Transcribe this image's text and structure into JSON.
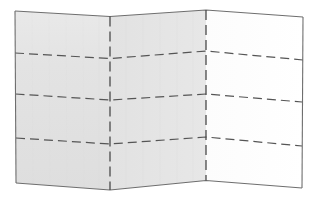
{
  "figure": {
    "width": 315,
    "height": 200,
    "background_color": "#ffffff"
  },
  "colors": {
    "panel_shaded": "#e2e2e2",
    "panel_shaded_light": "#e6e6e6",
    "panel_white": "#ffffff",
    "outline": "#6e6e6e",
    "crease_dash": "#555555",
    "fold_dash": "#4a4a4a"
  },
  "geometry": {
    "vertices": {
      "left_top": {
        "x": 15,
        "y": 11
      },
      "left_bottom": {
        "x": 16,
        "y": 183
      },
      "fold1_top": {
        "x": 110,
        "y": 16.5
      },
      "fold1_bottom": {
        "x": 110,
        "y": 190
      },
      "fold2_top": {
        "x": 206,
        "y": 10
      },
      "fold2_bottom": {
        "x": 206,
        "y": 180.5
      },
      "right_top": {
        "x": 303,
        "y": 17
      },
      "right_bottom": {
        "x": 302,
        "y": 188
      }
    },
    "creases": [
      {
        "name": "crease-1",
        "points": [
          {
            "x": 15,
            "y": 53
          },
          {
            "x": 110,
            "y": 58.5
          },
          {
            "x": 206,
            "y": 51
          },
          {
            "x": 303,
            "y": 60
          }
        ]
      },
      {
        "name": "crease-2",
        "points": [
          {
            "x": 15.5,
            "y": 94
          },
          {
            "x": 110,
            "y": 100
          },
          {
            "x": 206,
            "y": 94
          },
          {
            "x": 302,
            "y": 102
          }
        ]
      },
      {
        "name": "crease-3",
        "points": [
          {
            "x": 16,
            "y": 138
          },
          {
            "x": 110,
            "y": 144
          },
          {
            "x": 206,
            "y": 137
          },
          {
            "x": 302,
            "y": 146
          }
        ]
      }
    ]
  },
  "panels": [
    {
      "id": "panel-left",
      "label": "left-panel",
      "fill": "#e2e2e2",
      "shaded": true
    },
    {
      "id": "panel-middle",
      "label": "middle-panel",
      "fill": "#e4e4e4",
      "shaded": true
    },
    {
      "id": "panel-right",
      "label": "right-panel",
      "fill": "#ffffff",
      "shaded": false
    }
  ],
  "folds": [
    {
      "id": "fold-1",
      "label": "valley-fold-line",
      "x_top": 110,
      "x_bottom": 110
    },
    {
      "id": "fold-2",
      "label": "mountain-fold-line",
      "x_top": 206,
      "x_bottom": 206
    }
  ],
  "strokes": {
    "outline_width": 1.1,
    "crease_width": 1.2,
    "crease_dasharray": "9 5",
    "fold_width": 1.3,
    "fold_dasharray": "10 5"
  }
}
